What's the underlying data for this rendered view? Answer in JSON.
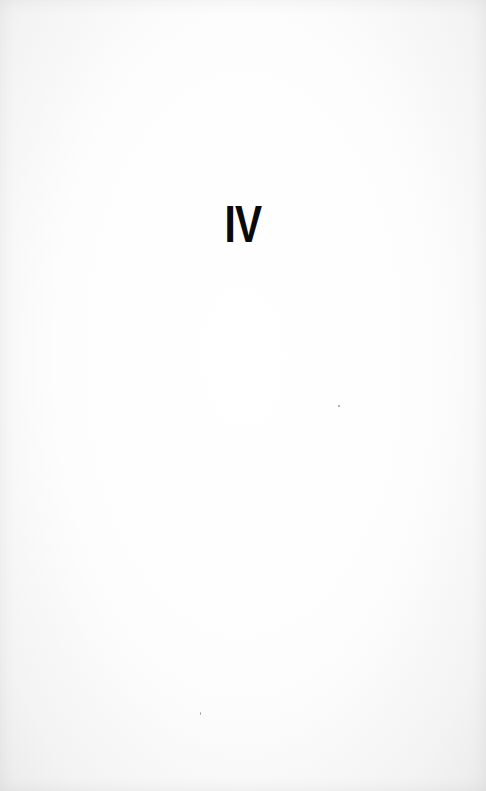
{
  "page": {
    "heading": "IV",
    "colors": {
      "background": "#fdfdfd",
      "text": "#0a0a0a"
    }
  }
}
